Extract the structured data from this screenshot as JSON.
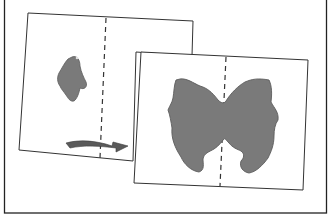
{
  "figure": {
    "colors": {
      "background": "#ffffff",
      "frame": "#222222",
      "paper": "#ffffff",
      "paper_edge": "#333333",
      "fold_line": "#333333",
      "blot": "#7a7a7a",
      "blot_edge": "#5c5c5c",
      "arrow": "#555555"
    },
    "panels": [
      {
        "id": "before",
        "label": ""
      },
      {
        "id": "after",
        "label": ""
      }
    ]
  }
}
